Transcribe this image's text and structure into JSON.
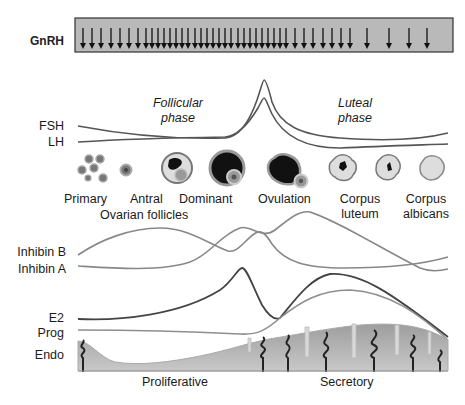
{
  "gnrh": {
    "label": "GnRH",
    "box": {
      "x": 75,
      "y": 18,
      "w": 378,
      "h": 34,
      "fill": "#b9b9b9"
    },
    "arrow_x": [
      83,
      92,
      101,
      111,
      120,
      129,
      138,
      146,
      152,
      158,
      164,
      170,
      176,
      182,
      188,
      195,
      201,
      207,
      213,
      219,
      225,
      231,
      238,
      244,
      250,
      256,
      262,
      268,
      274,
      280,
      286,
      295,
      304,
      313,
      323,
      332,
      341,
      350,
      367,
      389,
      409,
      427
    ]
  },
  "phases": {
    "follicular": [
      "Follicular",
      "phase"
    ],
    "luteal": [
      "Luteal",
      "phase"
    ]
  },
  "hormone_labels": {
    "fsh": "FSH",
    "lh": "LH",
    "inhibin_b": "Inhibin B",
    "inhibin_a": "Inhibin A",
    "e2": "E2",
    "prog": "Prog",
    "endo": "Endo"
  },
  "follicles": {
    "primary": "Primary",
    "antral": "Antral",
    "dominant": "Dominant",
    "ovulation": "Ovulation",
    "corpus_luteum": [
      "Corpus",
      "luteum"
    ],
    "corpus_albicans": [
      "Corpus",
      "albicans"
    ],
    "group_label": "Ovarian follicles"
  },
  "endometrium": {
    "proliferative": "Proliferative",
    "secretory": "Secretory"
  },
  "colors": {
    "dark_curve": "#4a4a4a",
    "light_curve": "#8a8a8a",
    "endo_fill": "#a8a8a8"
  }
}
